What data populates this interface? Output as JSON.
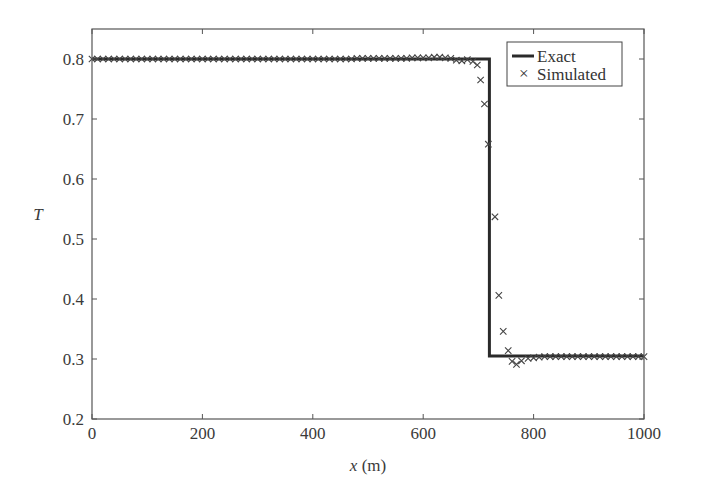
{
  "chart_data": {
    "type": "line",
    "title": "",
    "xlabel": "x (m)",
    "xlabel_var": "x",
    "xlabel_unit": " (m)",
    "ylabel": "T",
    "xlim": [
      0,
      1000
    ],
    "ylim": [
      0.2,
      0.85
    ],
    "xticks": [
      0,
      200,
      400,
      600,
      800,
      1000
    ],
    "yticks": [
      0.2,
      0.3,
      0.4,
      0.5,
      0.6,
      0.7,
      0.8
    ],
    "ytick_labels": [
      "0.2",
      "0.3",
      "0.4",
      "0.5",
      "0.6",
      "0.7",
      "0.8"
    ],
    "grid": false,
    "legend_position": "upper right",
    "series": [
      {
        "name": "Exact",
        "style": "solid-line",
        "color": "#2a2a2a",
        "x": [
          0,
          720,
          720,
          1000
        ],
        "y": [
          0.8,
          0.8,
          0.305,
          0.305
        ]
      },
      {
        "name": "Simulated",
        "style": "x-marker",
        "color": "#444444",
        "x": [
          0,
          10,
          20,
          30,
          40,
          50,
          60,
          70,
          80,
          90,
          100,
          110,
          120,
          130,
          140,
          150,
          160,
          170,
          180,
          190,
          200,
          210,
          220,
          230,
          240,
          250,
          260,
          270,
          280,
          290,
          300,
          310,
          320,
          330,
          340,
          350,
          360,
          370,
          380,
          390,
          400,
          410,
          420,
          430,
          440,
          450,
          460,
          470,
          480,
          490,
          500,
          510,
          520,
          530,
          540,
          550,
          560,
          570,
          580,
          590,
          600,
          610,
          620,
          630,
          640,
          650,
          660,
          670,
          680,
          690,
          698,
          704,
          711,
          718,
          730,
          737,
          745,
          754,
          761,
          769,
          778,
          790,
          800,
          810,
          820,
          830,
          840,
          850,
          860,
          870,
          880,
          890,
          900,
          910,
          920,
          930,
          940,
          950,
          960,
          970,
          980,
          990,
          1000
        ],
        "y": [
          0.8,
          0.8,
          0.8,
          0.8,
          0.8,
          0.8,
          0.8,
          0.8,
          0.8,
          0.8,
          0.8,
          0.8,
          0.8,
          0.8,
          0.8,
          0.8,
          0.8,
          0.8,
          0.8,
          0.8,
          0.8,
          0.8,
          0.8,
          0.8,
          0.8,
          0.8,
          0.8,
          0.8,
          0.8,
          0.8,
          0.8,
          0.8,
          0.8,
          0.8,
          0.8,
          0.8,
          0.8,
          0.8,
          0.8,
          0.8,
          0.8,
          0.8,
          0.8,
          0.8,
          0.8,
          0.8,
          0.8,
          0.8,
          0.801,
          0.801,
          0.801,
          0.801,
          0.801,
          0.801,
          0.801,
          0.801,
          0.801,
          0.801,
          0.802,
          0.802,
          0.802,
          0.802,
          0.803,
          0.803,
          0.802,
          0.801,
          0.798,
          0.797,
          0.799,
          0.796,
          0.79,
          0.765,
          0.725,
          0.658,
          0.537,
          0.406,
          0.346,
          0.314,
          0.296,
          0.291,
          0.297,
          0.301,
          0.302,
          0.303,
          0.304,
          0.304,
          0.304,
          0.304,
          0.304,
          0.304,
          0.304,
          0.304,
          0.304,
          0.304,
          0.304,
          0.304,
          0.304,
          0.304,
          0.304,
          0.304,
          0.304,
          0.304,
          0.304
        ]
      }
    ]
  },
  "legend": {
    "items": [
      {
        "label": "Exact",
        "symbol": "line"
      },
      {
        "label": "Simulated",
        "symbol": "×"
      }
    ]
  },
  "layout_colors": {
    "axis": "#555555",
    "exact_line": "#2a2a2a",
    "marker": "#444444"
  }
}
